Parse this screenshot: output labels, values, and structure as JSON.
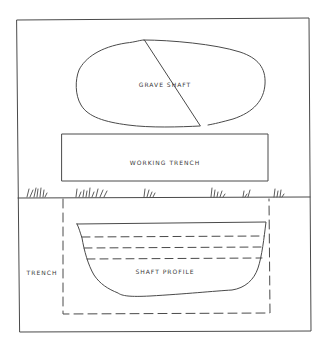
{
  "diagram": {
    "type": "archaeological burial excavation schematic (plan and section)",
    "colors": {
      "line": "#4a4a4a",
      "text": "#3a3a3a",
      "background": "#ffffff"
    },
    "plan_view": {
      "grave_shaft": {
        "label": "GRAVE SHAFT",
        "shape": "irregular oval"
      },
      "working_trench": {
        "label": "WORKING TRENCH",
        "shape": "rectangle"
      }
    },
    "ground_surface": {
      "feature": "grass tufts along ground line",
      "tuft_count": 6
    },
    "section_view": {
      "trench": {
        "label": "TRENCH",
        "style": "dashed outline"
      },
      "shaft_profile": {
        "label": "SHAFT PROFILE",
        "fill_layers_dashed_lines": 3
      }
    }
  }
}
